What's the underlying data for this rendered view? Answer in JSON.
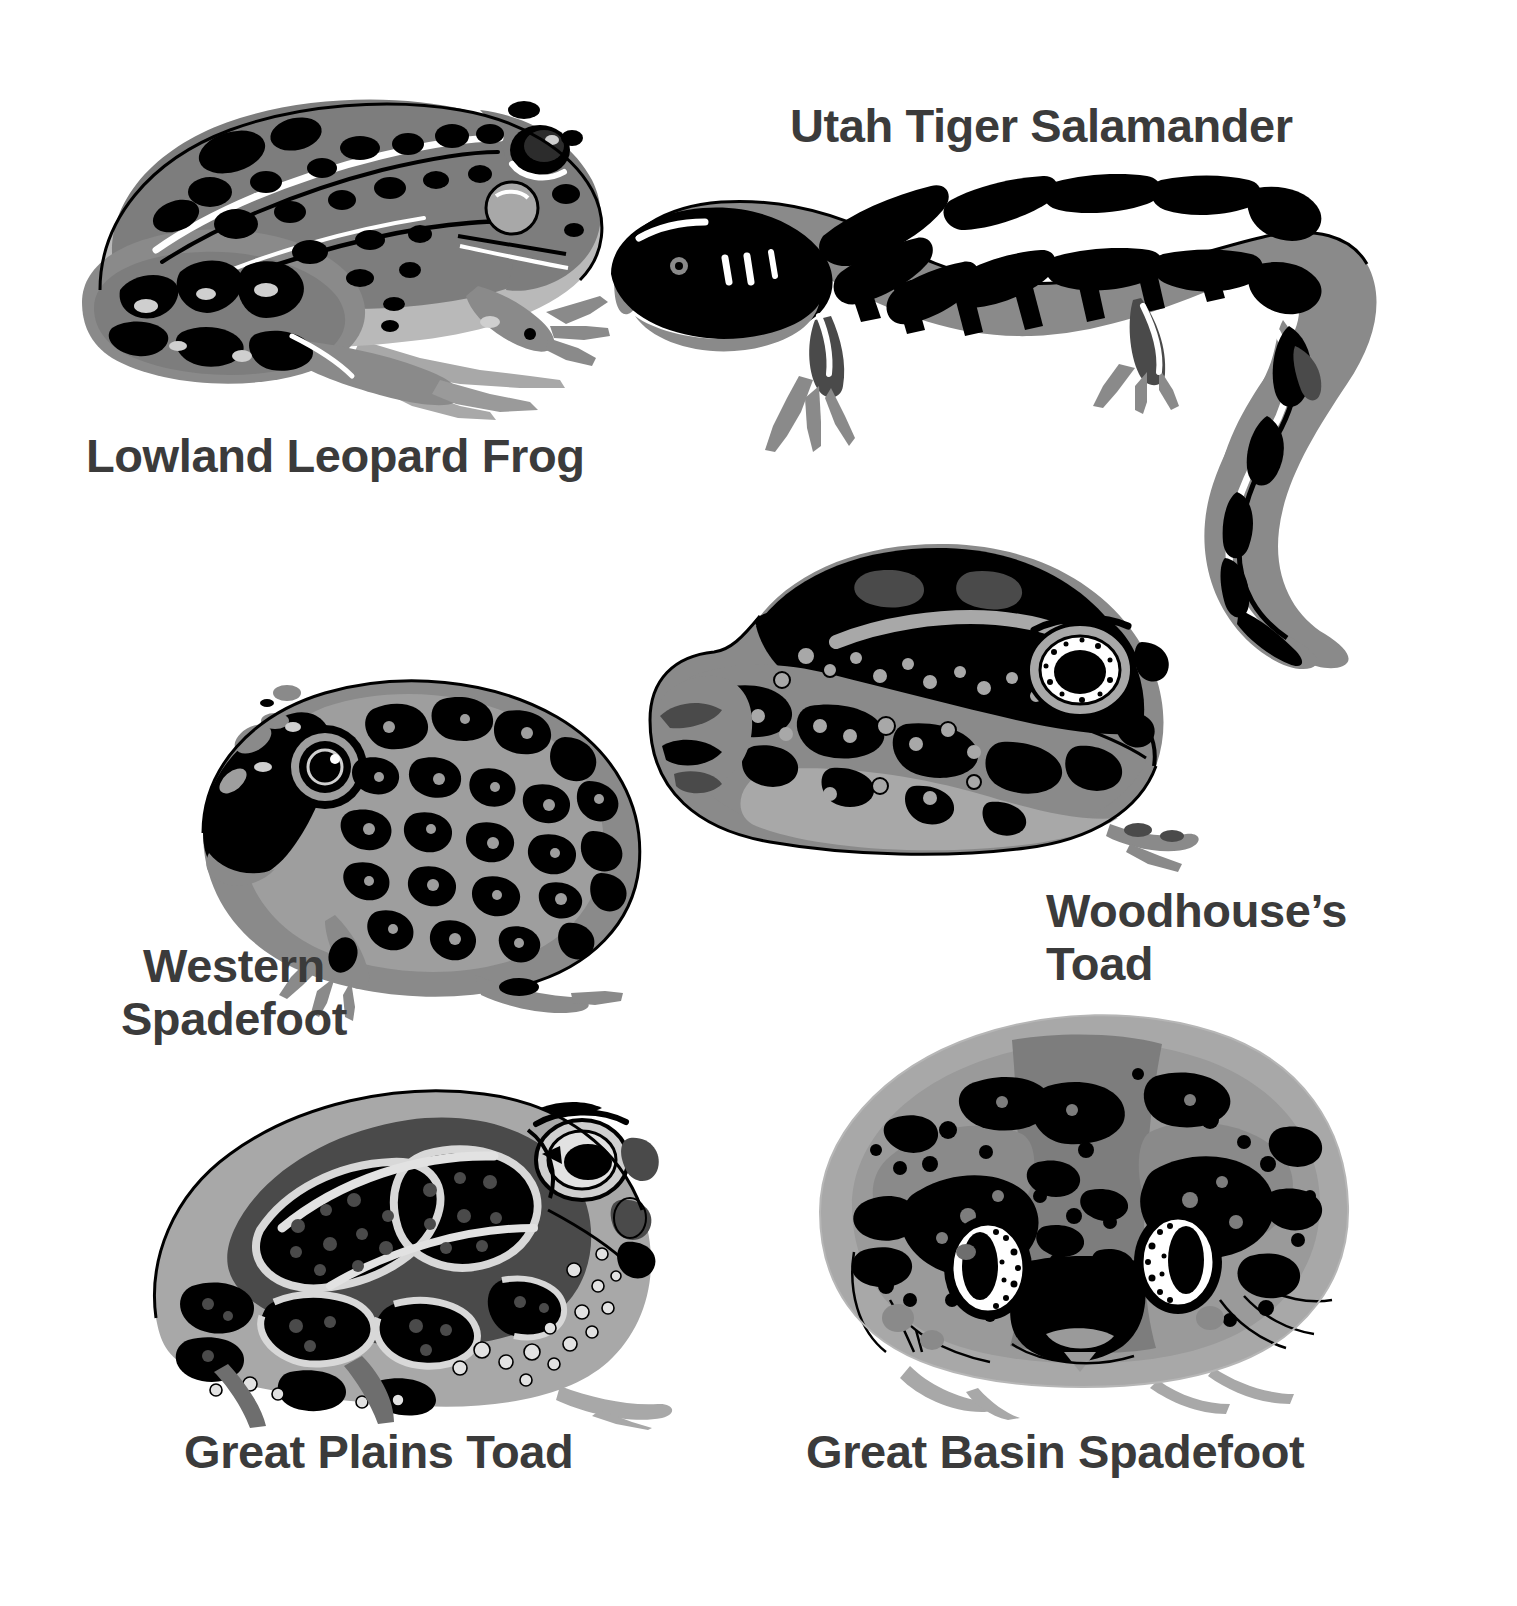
{
  "plate": {
    "background_color": "#ffffff",
    "label_color": "#3b3b3b",
    "palette": {
      "black": "#000000",
      "dark_gray": "#4a4a4a",
      "mid_gray": "#7d7d7d",
      "light_gray": "#a8a8a8",
      "pale_gray": "#cfcfcf",
      "white": "#ffffff"
    },
    "style": "posterized grayscale scientific illustration"
  },
  "species": [
    {
      "id": "lowland-leopard-frog",
      "label": "Lowland Leopard Frog",
      "group": "frog",
      "pose": "side profile facing right, sitting",
      "markings": "large black dorsal spots on gray body, pale dorsolateral ridges",
      "label_lines": 1
    },
    {
      "id": "utah-tiger-salamander",
      "label": "Utah Tiger Salamander",
      "group": "salamander",
      "pose": "full body facing left with long curving tail",
      "markings": "bold black blotches and bars over gray, pale dorsal stripe",
      "label_lines": 1
    },
    {
      "id": "western-spadefoot",
      "label": "Western\nSpadefoot",
      "group": "spadefoot toad",
      "pose": "side profile facing left, squat",
      "markings": "dense black mottling on gray, large round eye with pale iris ring",
      "label_lines": 2
    },
    {
      "id": "woodhouses-toad",
      "label": "Woodhouse’s\nToad",
      "group": "toad",
      "pose": "three-quarter view facing right, squat",
      "markings": "dark warty back with pale vertebral stripe, speckled flanks",
      "label_lines": 2
    },
    {
      "id": "great-plains-toad",
      "label": "Great Plains Toad",
      "group": "toad",
      "pose": "side profile facing right, sitting",
      "markings": "large dark paired blotches edged with pale outlines, warty skin",
      "label_lines": 1
    },
    {
      "id": "great-basin-spadefoot",
      "label": "Great Basin Spadefoot",
      "group": "spadefoot toad",
      "pose": "front-on dorsal view, wide rounded body",
      "markings": "dark irregular blotches on gray, two large speckled eyes",
      "label_lines": 1
    }
  ]
}
